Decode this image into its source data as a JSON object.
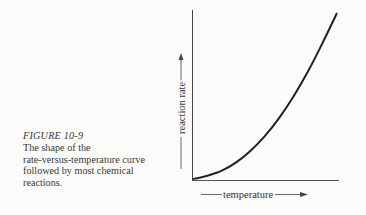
{
  "caption": {
    "figure_label": "FIGURE 10-9",
    "lines": [
      "The shape of the",
      "rate-versus-temperature curve",
      "followed by most chemical",
      "reactions."
    ]
  },
  "chart_data": {
    "type": "line",
    "title": "",
    "xlabel": "temperature",
    "ylabel": "reaction rate",
    "x": [
      0,
      0.1,
      0.2,
      0.3,
      0.4,
      0.5,
      0.6,
      0.7,
      0.8,
      0.9,
      1.0
    ],
    "series": [
      {
        "name": "rate-versus-temperature curve",
        "values": [
          0,
          0.02,
          0.05,
          0.1,
          0.17,
          0.26,
          0.37,
          0.5,
          0.65,
          0.82,
          1.0
        ]
      }
    ],
    "xlim": [
      0,
      1
    ],
    "ylim": [
      0,
      1
    ],
    "grid": false,
    "ticks": "none",
    "line_color": "#222222"
  }
}
